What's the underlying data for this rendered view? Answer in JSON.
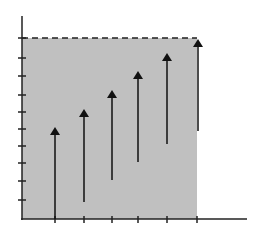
{
  "chart_data": {
    "type": "diagram",
    "title": "",
    "xlabel": "",
    "ylabel": "",
    "colors": {
      "region_fill": "#c0c0c0",
      "axis": "#222222",
      "arrow": "#111111",
      "dashed_line": "#222222",
      "background": "#ffffff"
    },
    "axes": {
      "origin": [
        22,
        219
      ],
      "y_axis_top": 16,
      "x_axis_right": 247,
      "y_ticks": [
        38,
        58,
        76,
        95,
        112,
        129,
        146,
        163,
        181,
        200
      ],
      "x_ticks": [
        55,
        84,
        112,
        138,
        167,
        197
      ]
    },
    "region": {
      "x0": 22,
      "y0": 38,
      "x1": 197,
      "y1": 219
    },
    "dashed_line": {
      "x0": 22,
      "x1": 197,
      "y": 38
    },
    "arrows": [
      {
        "x": 55,
        "y_start": 219,
        "y_end": 127
      },
      {
        "x": 84,
        "y_start": 202,
        "y_end": 109
      },
      {
        "x": 112,
        "y_start": 180,
        "y_end": 90
      },
      {
        "x": 138,
        "y_start": 162,
        "y_end": 71
      },
      {
        "x": 167,
        "y_start": 144,
        "y_end": 53
      },
      {
        "x": 198,
        "y_start": 131,
        "y_end": 39
      }
    ]
  }
}
